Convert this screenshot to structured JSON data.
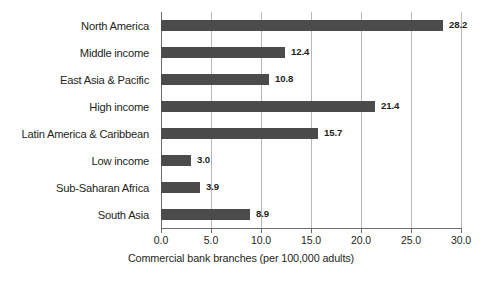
{
  "chart_data": {
    "type": "bar",
    "orientation": "horizontal",
    "title": "",
    "subtitle": "",
    "xlabel": "Commercial bank branches (per 100,000 adults)",
    "ylabel": "",
    "categories": [
      "North America",
      "Middle income",
      "East Asia & Pacific",
      "High income",
      "Latin America & Caribbean",
      "Low income",
      "Sub-Saharan Africa",
      "South Asia"
    ],
    "values": [
      28.2,
      12.4,
      10.8,
      21.4,
      15.7,
      3.0,
      3.9,
      8.9
    ],
    "value_labels": [
      "28.2",
      "12.4",
      "10.8",
      "21.4",
      "15.7",
      "3.0",
      "3.9",
      "8.9"
    ],
    "xlim": [
      0.0,
      30.0
    ],
    "xticks": [
      0.0,
      5.0,
      10.0,
      15.0,
      20.0,
      25.0,
      30.0
    ],
    "xtick_labels": [
      "0.0",
      "5.0",
      "10.0",
      "15.0",
      "20.0",
      "25.0",
      "30.0"
    ],
    "grid": {
      "vertical": true,
      "horizontal": false
    },
    "legend": {
      "visible": false,
      "position": "none",
      "entries": []
    },
    "colors": {
      "bar": "#4b4b4b",
      "gridline": "#b9b9b9",
      "axis": "#6d6d6d",
      "text": "#231f20",
      "background": "#ffffff"
    }
  }
}
